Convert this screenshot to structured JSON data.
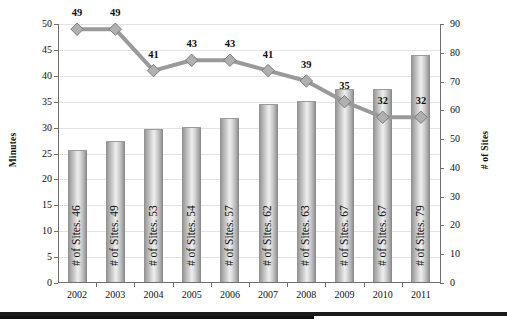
{
  "chart_data": {
    "type": "bar",
    "title": "",
    "xlabel": "",
    "categories": [
      "2002",
      "2003",
      "2004",
      "2005",
      "2006",
      "2007",
      "2008",
      "2009",
      "2010",
      "2011"
    ],
    "grid": true,
    "legend": "none",
    "axes": {
      "left": {
        "label": "Minutes",
        "min": 0,
        "max": 50,
        "step": 5,
        "ticks": [
          "0",
          "5",
          "10",
          "15",
          "20",
          "25",
          "30",
          "35",
          "40",
          "45",
          "50"
        ]
      },
      "right": {
        "label": "# of Sites",
        "min": 0,
        "max": 90,
        "step": 10,
        "ticks": [
          "0",
          "10",
          "20",
          "30",
          "40",
          "50",
          "60",
          "70",
          "80",
          "90"
        ]
      }
    },
    "series": [
      {
        "name": "# of Sites",
        "render": "bar",
        "axis": "right",
        "values": [
          46,
          49,
          53,
          54,
          57,
          62,
          63,
          67,
          67,
          79
        ],
        "labels": [
          "# of Sites. 46",
          "# of Sites. 49",
          "# of Sites. 53",
          "# of Sites. 54",
          "# of Sites. 57",
          "# of Sites. 62",
          "# of Sites. 63",
          "# of Sites. 67",
          "# of Sites. 67",
          "# of Sites. 79"
        ],
        "color": "#b4b4b4"
      },
      {
        "name": "Minutes",
        "render": "line",
        "axis": "left",
        "marker": "diamond",
        "values": [
          49,
          49,
          41,
          43,
          43,
          41,
          39,
          35,
          32,
          32
        ],
        "labels": [
          "49",
          "49",
          "41",
          "43",
          "43",
          "41",
          "39",
          "35",
          "32",
          "32"
        ],
        "color": "#9a9a9a"
      }
    ]
  },
  "colors": {
    "bar_fill": "#cccccc",
    "bar_edge": "#8f8f8f",
    "line": "#9a9a9a",
    "marker_fill": "#b0b0b0",
    "marker_edge": "#7d7d7d",
    "grid": "#e3e3e3",
    "axis": "#6f6f6f",
    "text": "#111111",
    "footer_rule": "#1b1b1b"
  }
}
